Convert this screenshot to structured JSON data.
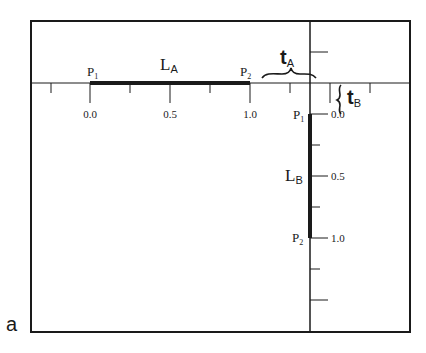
{
  "panel_label": "a",
  "horizontal_axis": {
    "tick_labels": [
      "0.0",
      "0.5",
      "1.0"
    ],
    "segment_label": "L",
    "segment_subscript": "A",
    "p1_label": "P",
    "p1_subscript": "1",
    "p2_label": "P",
    "p2_subscript": "2",
    "offset_label": "t",
    "offset_subscript": "A"
  },
  "vertical_axis": {
    "tick_labels": [
      "0.0",
      "0.5",
      "1.0"
    ],
    "segment_label": "L",
    "segment_subscript": "B",
    "p1_label": "P",
    "p1_subscript": "1",
    "p2_label": "P",
    "p2_subscript": "2",
    "offset_label": "t",
    "offset_subscript": "B"
  },
  "colors": {
    "ink": "#1a1a1a",
    "background": "#ffffff"
  }
}
